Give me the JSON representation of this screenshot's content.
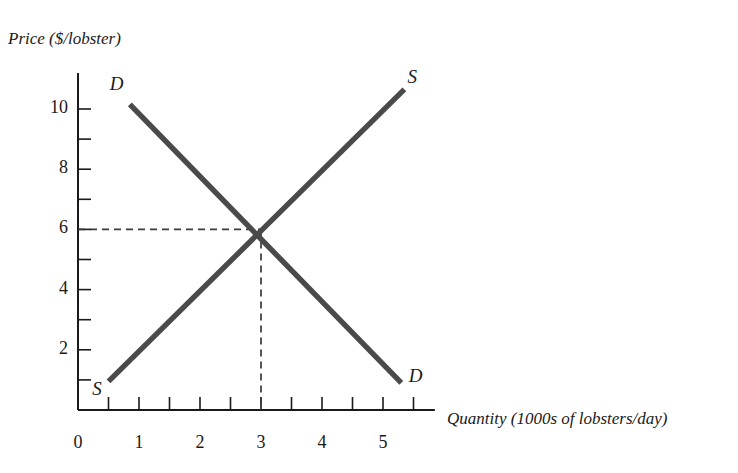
{
  "chart_data": {
    "type": "line",
    "title": "",
    "xlabel": "Quantity (1000s of lobsters/day)",
    "ylabel": "Price ($/lobster)",
    "xlim": [
      0,
      5.85
    ],
    "ylim": [
      0,
      11.2
    ],
    "grid": false,
    "legend": "none",
    "x_ticks_major": [
      0,
      1,
      2,
      3,
      4,
      5
    ],
    "x_tick_labels": [
      "0",
      "1",
      "2",
      "3",
      "4",
      "5"
    ],
    "x_ticks_minor": [
      0.5,
      1.5,
      2.5,
      3.5,
      4.5,
      5.5
    ],
    "y_ticks_major": [
      2,
      4,
      6,
      8,
      10
    ],
    "y_tick_labels": [
      "2",
      "4",
      "6",
      "8",
      "10"
    ],
    "y_ticks_minor": [
      1,
      3,
      5,
      7,
      9
    ],
    "series": [
      {
        "name": "D",
        "role": "demand",
        "points": [
          [
            0.85,
            10.15
          ],
          [
            5.3,
            0.9
          ]
        ],
        "labels": [
          {
            "text": "D",
            "x": 0.62,
            "y": 10.75
          },
          {
            "text": "D",
            "x": 5.52,
            "y": 1.05
          }
        ]
      },
      {
        "name": "S",
        "role": "supply",
        "points": [
          [
            0.5,
            0.95
          ],
          [
            5.35,
            10.65
          ]
        ],
        "labels": [
          {
            "text": "S",
            "x": 0.33,
            "y": 0.62
          },
          {
            "text": "S",
            "x": 5.5,
            "y": 11.0
          }
        ]
      }
    ],
    "equilibrium": {
      "quantity": 3,
      "price": 6,
      "guides": "dashed"
    },
    "colors": {
      "curve": "#4a4a4a",
      "axis": "#1a1a1a",
      "guide": "#3a3a3a",
      "background": "#ffffff",
      "text": "#1a1a1a"
    }
  }
}
